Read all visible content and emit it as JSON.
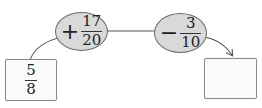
{
  "diagram": {
    "start": {
      "numerator": "5",
      "denominator": "8"
    },
    "operations": [
      {
        "sign": "+",
        "numerator": "17",
        "denominator": "20"
      },
      {
        "sign": "−",
        "numerator": "3",
        "denominator": "10"
      }
    ],
    "result": {
      "value": ""
    }
  },
  "colors": {
    "ellipse_fill": "#d9d9d9",
    "ellipse_stroke": "#6e6e6e",
    "box_stroke": "#8a8a8a",
    "line": "#555555"
  }
}
